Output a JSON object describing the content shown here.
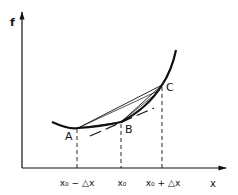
{
  "diagram": {
    "axes": {
      "y_label": "f",
      "x_label": "x"
    },
    "points": [
      {
        "id": "A",
        "label": "A"
      },
      {
        "id": "B",
        "label": "B"
      },
      {
        "id": "C",
        "label": "C"
      }
    ],
    "ticks": [
      {
        "label": "x₀ − △x"
      },
      {
        "label": "x₀"
      },
      {
        "label": "x₀ + △x"
      }
    ],
    "lines": {
      "secant_AC": "chord A-C",
      "secant_AB": "chord A-B",
      "secant_BC": "chord B-C",
      "tangent_B": "tangent at B (dashed)"
    },
    "colors": {
      "ink": "#111111",
      "background": "#ffffff"
    }
  }
}
